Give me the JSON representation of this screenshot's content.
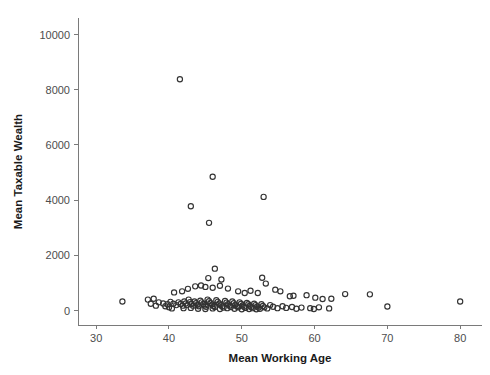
{
  "chart_data": {
    "type": "scatter",
    "title": "",
    "xlabel": "Mean Working Age",
    "ylabel": "Mean Taxable Wealth",
    "xlim": [
      27.5,
      83
    ],
    "ylim": [
      -520,
      10600
    ],
    "xticks": [
      30,
      40,
      50,
      60,
      70,
      80
    ],
    "xticklabels": [
      "30",
      "40",
      "50",
      "60",
      "70",
      "80"
    ],
    "yticks": [
      0,
      2000,
      4000,
      6000,
      8000,
      10000
    ],
    "yticklabels": [
      "0",
      "2000",
      "4000",
      "6000",
      "8000",
      "10000"
    ],
    "grid": false,
    "legend": null,
    "marker": "open-circle",
    "marker_color": "#333333",
    "marker_radius": 2.6,
    "background_color": "#ffffff",
    "axis_color": "#7a7a7a",
    "spines": [
      "left",
      "bottom"
    ],
    "series": [
      {
        "name": "municipalities",
        "points": [
          [
            41.5,
            8380
          ],
          [
            46.0,
            4850
          ],
          [
            53.0,
            4120
          ],
          [
            43.0,
            3780
          ],
          [
            45.5,
            3180
          ],
          [
            46.3,
            1520
          ],
          [
            45.4,
            1180
          ],
          [
            47.2,
            1130
          ],
          [
            52.8,
            1190
          ],
          [
            53.3,
            980
          ],
          [
            43.6,
            880
          ],
          [
            44.4,
            910
          ],
          [
            45.0,
            860
          ],
          [
            46.0,
            830
          ],
          [
            47.0,
            900
          ],
          [
            48.1,
            800
          ],
          [
            42.6,
            790
          ],
          [
            41.8,
            700
          ],
          [
            40.7,
            660
          ],
          [
            49.5,
            700
          ],
          [
            50.4,
            640
          ],
          [
            51.2,
            720
          ],
          [
            52.2,
            640
          ],
          [
            54.6,
            760
          ],
          [
            55.3,
            700
          ],
          [
            56.6,
            520
          ],
          [
            57.1,
            540
          ],
          [
            58.9,
            560
          ],
          [
            60.1,
            470
          ],
          [
            61.1,
            420
          ],
          [
            62.3,
            430
          ],
          [
            64.2,
            600
          ],
          [
            67.6,
            590
          ],
          [
            70.0,
            150
          ],
          [
            80.0,
            330
          ],
          [
            33.6,
            330
          ],
          [
            37.1,
            400
          ],
          [
            37.9,
            430
          ],
          [
            38.6,
            300
          ],
          [
            39.2,
            260
          ],
          [
            39.8,
            230
          ],
          [
            40.2,
            320
          ],
          [
            40.6,
            250
          ],
          [
            41.0,
            200
          ],
          [
            41.3,
            300
          ],
          [
            41.6,
            240
          ],
          [
            41.9,
            180
          ],
          [
            42.1,
            330
          ],
          [
            42.3,
            260
          ],
          [
            42.5,
            200
          ],
          [
            42.7,
            400
          ],
          [
            42.9,
            310
          ],
          [
            43.1,
            240
          ],
          [
            43.3,
            180
          ],
          [
            43.5,
            330
          ],
          [
            43.7,
            270
          ],
          [
            43.9,
            210
          ],
          [
            44.1,
            160
          ],
          [
            44.3,
            360
          ],
          [
            44.5,
            300
          ],
          [
            44.7,
            240
          ],
          [
            44.9,
            190
          ],
          [
            45.1,
            140
          ],
          [
            45.3,
            400
          ],
          [
            45.5,
            340
          ],
          [
            45.7,
            280
          ],
          [
            45.9,
            220
          ],
          [
            46.1,
            170
          ],
          [
            46.3,
            130
          ],
          [
            46.5,
            380
          ],
          [
            46.7,
            320
          ],
          [
            46.9,
            260
          ],
          [
            47.1,
            200
          ],
          [
            47.3,
            150
          ],
          [
            47.5,
            110
          ],
          [
            47.7,
            350
          ],
          [
            47.9,
            290
          ],
          [
            48.1,
            230
          ],
          [
            48.3,
            180
          ],
          [
            48.5,
            130
          ],
          [
            48.7,
            330
          ],
          [
            48.9,
            270
          ],
          [
            49.1,
            210
          ],
          [
            49.3,
            160
          ],
          [
            49.5,
            120
          ],
          [
            49.7,
            300
          ],
          [
            49.9,
            250
          ],
          [
            50.1,
            190
          ],
          [
            50.3,
            140
          ],
          [
            50.5,
            100
          ],
          [
            50.7,
            280
          ],
          [
            50.9,
            230
          ],
          [
            51.1,
            180
          ],
          [
            51.3,
            130
          ],
          [
            51.5,
            90
          ],
          [
            51.7,
            250
          ],
          [
            51.9,
            200
          ],
          [
            52.1,
            150
          ],
          [
            52.3,
            110
          ],
          [
            52.5,
            70
          ],
          [
            52.7,
            230
          ],
          [
            52.9,
            170
          ],
          [
            53.1,
            120
          ],
          [
            53.5,
            80
          ],
          [
            53.9,
            200
          ],
          [
            54.3,
            140
          ],
          [
            54.9,
            90
          ],
          [
            55.6,
            160
          ],
          [
            56.1,
            100
          ],
          [
            56.9,
            130
          ],
          [
            57.5,
            70
          ],
          [
            58.2,
            110
          ],
          [
            59.4,
            90
          ],
          [
            59.9,
            60
          ],
          [
            60.6,
            120
          ],
          [
            62.0,
            80
          ],
          [
            40.0,
            120
          ],
          [
            40.4,
            80
          ],
          [
            39.5,
            160
          ],
          [
            38.2,
            180
          ],
          [
            37.5,
            250
          ],
          [
            42.0,
            90
          ],
          [
            43.0,
            100
          ],
          [
            44.0,
            70
          ],
          [
            45.0,
            60
          ],
          [
            46.0,
            80
          ],
          [
            47.0,
            60
          ],
          [
            48.0,
            90
          ],
          [
            49.0,
            70
          ],
          [
            50.0,
            50
          ],
          [
            51.0,
            60
          ],
          [
            52.0,
            50
          ]
        ]
      }
    ]
  }
}
